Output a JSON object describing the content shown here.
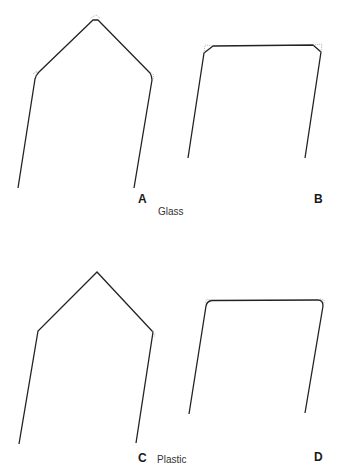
{
  "figure": {
    "panels": [
      {
        "id": "A",
        "letter": "A",
        "shape": "pointed-roof",
        "corner_style": "dotted-rounded"
      },
      {
        "id": "B",
        "letter": "B",
        "shape": "flat-top",
        "corner_style": "chamfered-dotted"
      },
      {
        "id": "C",
        "letter": "C",
        "shape": "pointed-roof",
        "corner_style": "sharp"
      },
      {
        "id": "D",
        "letter": "D",
        "shape": "flat-top",
        "corner_style": "rounded"
      }
    ],
    "materials": {
      "top_row": "Glass",
      "bottom_row": "Plastic"
    },
    "colors": {
      "stroke": "#222222",
      "dotted": "#9a9a9a",
      "background": "#ffffff"
    }
  }
}
